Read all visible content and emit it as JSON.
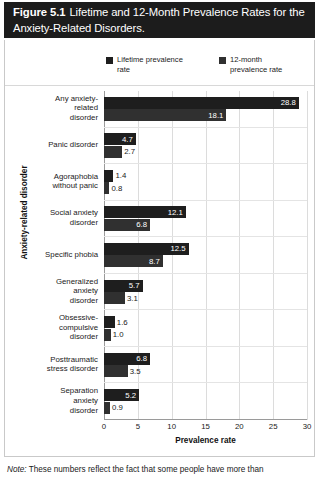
{
  "figure": {
    "title_number": "Figure 5.1",
    "title_line1": "Lifetime and 12-Month Prevalence Rates for the",
    "title_line2": "Anxiety-Related Disorders.",
    "note_prefix": "Note:",
    "note_text": "These numbers reflect the fact that some people have more than"
  },
  "chart_data": {
    "type": "bar",
    "orientation": "horizontal",
    "xlabel": "Prevalence rate",
    "ylabel": "Anxiety-related disorder",
    "xlim": [
      0,
      30
    ],
    "xticks": [
      0,
      5,
      10,
      15,
      20,
      25,
      30
    ],
    "grid": true,
    "legend_position": "top",
    "categories": [
      "Any anxiety-related disorder",
      "Panic disorder",
      "Agoraphobia without panic",
      "Social anxiety disorder",
      "Specific phobia",
      "Generalized anxiety disorder",
      "Obsessive-compulsive disorder",
      "Posttraumatic stress disorder",
      "Separation anxiety disorder"
    ],
    "category_lines": [
      [
        "Any anxiety-",
        "related",
        "disorder"
      ],
      [
        "Panic disorder"
      ],
      [
        "Agoraphobia",
        "without panic"
      ],
      [
        "Social anxiety",
        "disorder"
      ],
      [
        "Specific phobia"
      ],
      [
        "Generalized",
        "anxiety",
        "disorder"
      ],
      [
        "Obsessive-",
        "compulsive",
        "disorder"
      ],
      [
        "Posttraumatic",
        "stress disorder"
      ],
      [
        "Separation",
        "anxiety",
        "disorder"
      ]
    ],
    "series": [
      {
        "name": "Lifetime prevalence rate",
        "legend_lines": [
          "Lifetime prevalence",
          "rate"
        ],
        "color": "#1e1e1e",
        "values": [
          28.8,
          4.7,
          1.4,
          12.1,
          12.5,
          5.7,
          1.6,
          6.8,
          5.2
        ]
      },
      {
        "name": "12-month prevalence rate",
        "legend_lines": [
          "12-month",
          "prevalence rate"
        ],
        "color": "#303030",
        "values": [
          18.1,
          2.7,
          0.8,
          6.8,
          8.7,
          3.1,
          1.0,
          3.5,
          0.9
        ]
      }
    ]
  }
}
